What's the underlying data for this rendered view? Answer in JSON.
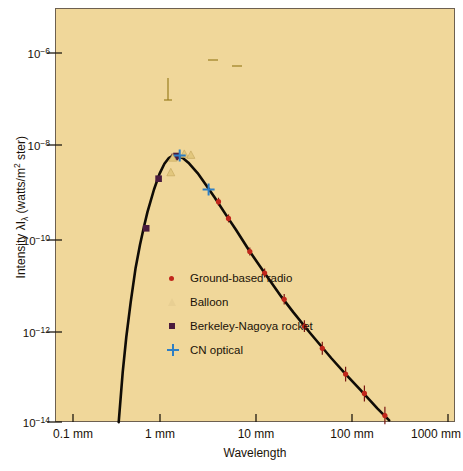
{
  "chart_data": {
    "type": "line",
    "title": "",
    "xlabel": "Wavelength",
    "ylabel": "Intensity λIλ (watts/m² ster)",
    "xscale": "log",
    "yscale": "log",
    "xlim_mm": [
      0.1,
      1000
    ],
    "ylim": [
      1e-14,
      3e-06
    ],
    "grid": false,
    "legend_position": "center-left-inside",
    "xticks": [
      {
        "value_mm": 0.1,
        "label": "0.1 mm"
      },
      {
        "value_mm": 1,
        "label": "1 mm"
      },
      {
        "value_mm": 10,
        "label": "10 mm"
      },
      {
        "value_mm": 100,
        "label": "100 mm"
      },
      {
        "value_mm": 1000,
        "label": "1000 mm"
      }
    ],
    "yticks": [
      {
        "value": 1e-06,
        "mantissa": "10",
        "exponent": "-6"
      },
      {
        "value": 1e-08,
        "mantissa": "10",
        "exponent": "-8"
      },
      {
        "value": 1e-10,
        "mantissa": "10",
        "exponent": "-10"
      },
      {
        "value": 1e-12,
        "mantissa": "10",
        "exponent": "-12"
      },
      {
        "value": 1e-14,
        "mantissa": "10",
        "exponent": "-14"
      }
    ],
    "legend": [
      {
        "label": "Ground-based radio",
        "marker": "dot",
        "color": "#c0261b"
      },
      {
        "label": "Balloon",
        "marker": "triangle",
        "color": "#e8cf93"
      },
      {
        "label": "Berkeley-Nagoya rocket",
        "marker": "square",
        "color": "#4a1b3d"
      },
      {
        "label": "CN optical",
        "marker": "plus",
        "color": "#2f7fc4"
      }
    ],
    "series": [
      {
        "name": "Blackbody curve 2.7 K",
        "type": "line",
        "color": "#100c06",
        "points_mm_intensity": [
          [
            0.3,
            1e-14
          ],
          [
            0.33,
            1.2e-13
          ],
          [
            0.36,
            7e-13
          ],
          [
            0.4,
            4e-12
          ],
          [
            0.45,
            2.2e-11
          ],
          [
            0.5,
            7e-11
          ],
          [
            0.55,
            1.7e-10
          ],
          [
            0.6,
            3.6e-10
          ],
          [
            0.7,
            1.1e-09
          ],
          [
            0.8,
            2.4e-09
          ],
          [
            0.9,
            4e-09
          ],
          [
            1.0,
            5.3e-09
          ],
          [
            1.1,
            6e-09
          ],
          [
            1.2,
            6.1e-09
          ],
          [
            1.4,
            5.3e-09
          ],
          [
            1.6,
            4.2e-09
          ],
          [
            2.0,
            2.5e-09
          ],
          [
            2.5,
            1.3e-09
          ],
          [
            3.0,
            7.5e-10
          ],
          [
            4.0,
            3e-10
          ],
          [
            5.0,
            1.5e-10
          ],
          [
            7.0,
            5e-11
          ],
          [
            10.0,
            1.7e-11
          ],
          [
            15.0,
            5.2e-12
          ],
          [
            20.0,
            2.4e-12
          ],
          [
            30.0,
            8.5e-13
          ],
          [
            50.0,
            2.4e-13
          ],
          [
            70.0,
            1.1e-13
          ],
          [
            100.0,
            5e-14
          ],
          [
            150.0,
            2e-14
          ],
          [
            200.0,
            1.1e-14
          ],
          [
            300.0,
            4.5e-15
          ],
          [
            500.0,
            1.5e-15
          ],
          [
            700.0,
            7e-16
          ],
          [
            1000.0,
            3.2e-16
          ],
          [
            1300.0,
            1.8e-16
          ]
        ]
      },
      {
        "name": "Ground-based radio",
        "type": "scatter",
        "marker": "dot",
        "color": "#c0261b",
        "points_mm_intensity": [
          [
            3.3,
            6e-10
          ],
          [
            4.2,
            2.6e-10
          ],
          [
            7.0,
            5e-11
          ],
          [
            10.0,
            1.7e-11
          ],
          [
            16.0,
            4.6e-12
          ],
          [
            26.0,
            1.2e-12
          ],
          [
            40.0,
            4e-13
          ],
          [
            70.0,
            1.1e-13
          ],
          [
            110.0,
            4.2e-14
          ],
          [
            180.0,
            1.4e-14
          ],
          [
            300.0,
            4.5e-15
          ],
          [
            500.0,
            1.5e-15
          ],
          [
            760.0,
            6e-16
          ]
        ],
        "has_error_bars": true
      },
      {
        "name": "Balloon",
        "type": "scatter",
        "marker": "triangle",
        "color": "#d8b860",
        "points_mm_intensity": [
          [
            1.05,
            2.6e-09
          ],
          [
            1.1,
            5.4e-09
          ],
          [
            1.45,
            6.5e-09
          ],
          [
            1.7,
            6.2e-09
          ]
        ],
        "has_error_bars": true
      },
      {
        "name": "Berkeley-Nagoya rocket",
        "type": "scatter",
        "marker": "square",
        "color": "#4a1b3d",
        "points_mm_intensity": [
          [
            0.58,
            1.6e-10
          ],
          [
            0.78,
            1.9e-09
          ],
          [
            1.15,
            5.6e-09
          ],
          [
            1.2,
            5.9e-09
          ]
        ]
      },
      {
        "name": "CN optical",
        "type": "scatter",
        "marker": "plus",
        "color": "#2f7fc4",
        "points_mm_intensity": [
          [
            1.3,
            6e-09
          ],
          [
            2.6,
            1.1e-09
          ]
        ]
      }
    ]
  },
  "axes": {
    "x_title": "Wavelength",
    "y_title_prefix": "Intensity λI",
    "y_title_sub": "λ",
    "y_title_suffix": " (watts/m",
    "y_title_sup": "2",
    "y_title_tail": " ster)"
  },
  "colors": {
    "plot_background": "#f0d79a",
    "page_background": "#ffffff",
    "curve": "#100c06",
    "frame": "#6d6050",
    "radio": "#c0261b",
    "balloon": "#e8cf93",
    "rocket": "#4a1b3d",
    "cn_optical": "#2f7fc4",
    "text": "#1a1208"
  }
}
